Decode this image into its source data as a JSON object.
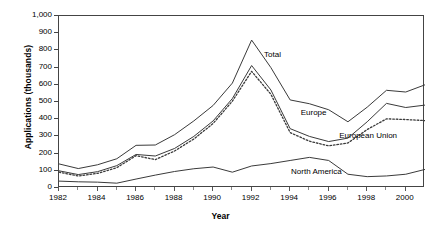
{
  "chart_data": {
    "type": "line",
    "title": "",
    "xlabel": "Year",
    "ylabel": "Applications (thousands)",
    "xlim": [
      1982,
      2001
    ],
    "ylim": [
      0,
      1000
    ],
    "grid": false,
    "legend_position": "inline-annotations",
    "x": [
      1982,
      1983,
      1984,
      1985,
      1986,
      1987,
      1988,
      1989,
      1990,
      1991,
      1992,
      1993,
      1994,
      1995,
      1996,
      1997,
      1998,
      1999,
      2000,
      2001
    ],
    "xtick_labels": [
      "1982",
      "1984",
      "1986",
      "1988",
      "1990",
      "1992",
      "1994",
      "1996",
      "1998",
      "2000"
    ],
    "xtick_values": [
      1982,
      1984,
      1986,
      1988,
      1990,
      1992,
      1994,
      1996,
      1998,
      2000
    ],
    "ytick_labels": [
      "0",
      "100",
      "200",
      "300",
      "400",
      "500",
      "600",
      "700",
      "800",
      "900",
      "1,000"
    ],
    "ytick_values": [
      0,
      100,
      200,
      300,
      400,
      500,
      600,
      700,
      800,
      900,
      1000
    ],
    "series": [
      {
        "name": "Total",
        "style": "solid",
        "color": "#3a3a3a",
        "label_x": 1992.7,
        "label_y": 770,
        "values": [
          140,
          113,
          135,
          170,
          248,
          250,
          310,
          390,
          480,
          610,
          860,
          700,
          512,
          490,
          455,
          385,
          470,
          568,
          558,
          600
        ]
      },
      {
        "name": "Europe",
        "style": "solid",
        "color": "#3a3a3a",
        "label_x": 1994.6,
        "label_y": 430,
        "values": [
          100,
          78,
          95,
          130,
          195,
          186,
          230,
          300,
          390,
          520,
          712,
          570,
          345,
          300,
          270,
          290,
          385,
          492,
          468,
          482
        ]
      },
      {
        "name": "European Union",
        "style": "dotted",
        "color": "#3a3a3a",
        "label_x": 1996.6,
        "label_y": 296,
        "values": [
          92,
          70,
          85,
          118,
          188,
          165,
          215,
          285,
          375,
          505,
          678,
          545,
          322,
          272,
          245,
          262,
          340,
          402,
          398,
          392
        ]
      },
      {
        "name": "North America",
        "style": "solid",
        "color": "#3a3a3a",
        "label_x": 1994.1,
        "label_y": 88,
        "values": [
          40,
          36,
          34,
          28,
          52,
          75,
          96,
          112,
          122,
          92,
          128,
          142,
          160,
          178,
          160,
          80,
          66,
          70,
          80,
          108
        ]
      }
    ]
  },
  "axes": {
    "x_title": "Year",
    "y_title": "Applications (thousands)"
  }
}
